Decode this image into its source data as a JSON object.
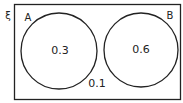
{
  "diagram": {
    "type": "venn",
    "universal_symbol": "ξ",
    "sets": [
      {
        "label": "A",
        "value_only": "0.3"
      },
      {
        "label": "B",
        "value_only": "0.6"
      }
    ],
    "outside": "0.1",
    "line_color": "#222222"
  }
}
